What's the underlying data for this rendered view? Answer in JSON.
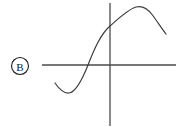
{
  "figure": {
    "background_color": "#ffffff",
    "stroke_color": "#4a4a4a",
    "curve_color": "#3c3c3c",
    "label_color": "#1a1a1a",
    "axis_stroke_width": 1.2,
    "curve_stroke_width": 1.2
  },
  "label": {
    "text": "B",
    "style": "circled-letter",
    "center_x": 20,
    "center_y": 66,
    "radius": 8.5
  },
  "axes": {
    "x_axis": {
      "name": "horizontal-axis",
      "y": 65,
      "x_start": 42,
      "x_end": 176
    },
    "y_axis": {
      "name": "vertical-axis",
      "x": 110,
      "y_start": 3,
      "y_end": 126
    },
    "origin_x": 110,
    "origin_y": 65
  },
  "chart_data": {
    "type": "line",
    "title": "",
    "subtitle": "",
    "xlabel": "",
    "ylabel": "",
    "grid": false,
    "legend": null,
    "annotations": [
      "B"
    ],
    "axis_ranges": {
      "x_pixels": [
        42,
        176
      ],
      "y_pixels": [
        3,
        126
      ]
    },
    "key_points": [
      {
        "label": "left-endpoint",
        "x": 55,
        "y": 83
      },
      {
        "label": "local-minimum",
        "x": 69,
        "y": 93
      },
      {
        "label": "x-intercept",
        "x": 88,
        "y": 65
      },
      {
        "label": "y-intercept",
        "x": 110,
        "y": 26
      },
      {
        "label": "local-maximum",
        "x": 139,
        "y": 7
      },
      {
        "label": "right-endpoint",
        "x": 166,
        "y": 34
      }
    ],
    "path_d": "M 55,83 C 59.5,89.5 64,93.5 69,93 C 75,92.4 80.5,84 88,65 C 95,47 101,34 110,26 C 118.5,18.5 128,9.5 136,7 C 142,5.3 147.5,8.5 152,14.5 C 157,21 162,29 166,34"
  }
}
